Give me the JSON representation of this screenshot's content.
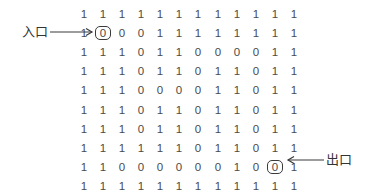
{
  "maze": {
    "rows": [
      [
        "1",
        "1",
        "1",
        "1",
        "1",
        "1",
        "1",
        "1",
        "1",
        "1",
        "1",
        "1"
      ],
      [
        "1",
        "0",
        "0",
        "0",
        "1",
        "1",
        "1",
        "1",
        "1",
        "1",
        "1",
        "1"
      ],
      [
        "1",
        "1",
        "1",
        "0",
        "1",
        "1",
        "0",
        "0",
        "0",
        "0",
        "1",
        "1"
      ],
      [
        "1",
        "1",
        "1",
        "0",
        "1",
        "1",
        "0",
        "1",
        "1",
        "0",
        "1",
        "1"
      ],
      [
        "1",
        "1",
        "1",
        "0",
        "0",
        "0",
        "0",
        "1",
        "1",
        "0",
        "1",
        "1"
      ],
      [
        "1",
        "1",
        "1",
        "0",
        "1",
        "1",
        "0",
        "1",
        "1",
        "0",
        "1",
        "1"
      ],
      [
        "1",
        "1",
        "1",
        "0",
        "1",
        "1",
        "0",
        "1",
        "1",
        "0",
        "1",
        "1"
      ],
      [
        "1",
        "1",
        "1",
        "1",
        "1",
        "1",
        "0",
        "1",
        "1",
        "0",
        "1",
        "1"
      ],
      [
        "1",
        "1",
        "0",
        "0",
        "0",
        "0",
        "0",
        "0",
        "1",
        "0",
        "0",
        "1"
      ],
      [
        "1",
        "1",
        "1",
        "1",
        "1",
        "1",
        "1",
        "1",
        "1",
        "1",
        "1",
        "1"
      ]
    ],
    "entrance": {
      "label": "入口",
      "row": 1,
      "col": 1
    },
    "exit": {
      "label": "出口",
      "row": 8,
      "col": 10
    }
  }
}
